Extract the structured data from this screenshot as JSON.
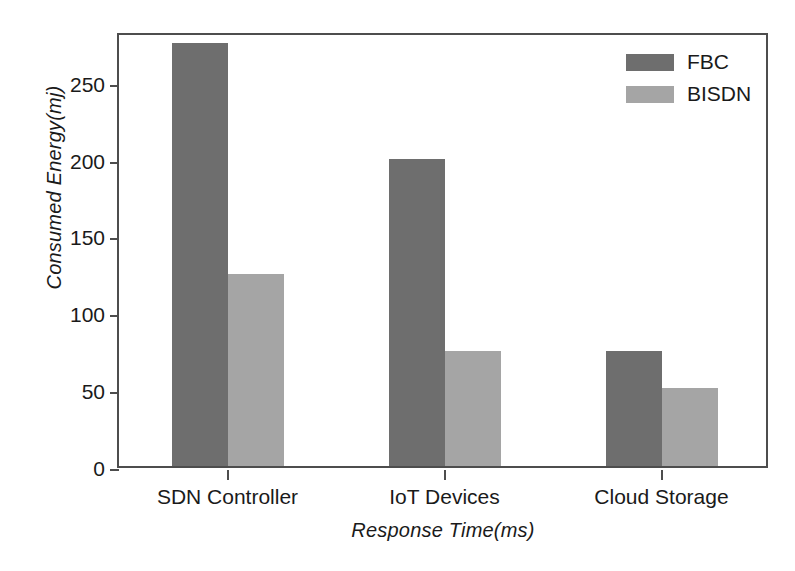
{
  "chart_data": {
    "type": "bar",
    "title": "",
    "xlabel": "Response Time(ms)",
    "ylabel": "Consumed Energy(mj)",
    "categories": [
      "SDN Controller",
      "IoT Devices",
      "Cloud Storage"
    ],
    "series": [
      {
        "name": "FBC",
        "color": "#6e6e6e",
        "values": [
          275,
          200,
          75
        ]
      },
      {
        "name": "BISDN",
        "color": "#a5a5a5",
        "values": [
          125,
          75,
          51
        ]
      }
    ],
    "ylim": [
      0,
      283
    ],
    "yticks": [
      0,
      50,
      100,
      150,
      200,
      250
    ],
    "ytick_labels": [
      "0",
      "50",
      "100",
      "150",
      "200",
      "250"
    ],
    "grid": false,
    "legend_position": "top-right",
    "legend_entries": [
      "FBC",
      "BISDN"
    ]
  }
}
